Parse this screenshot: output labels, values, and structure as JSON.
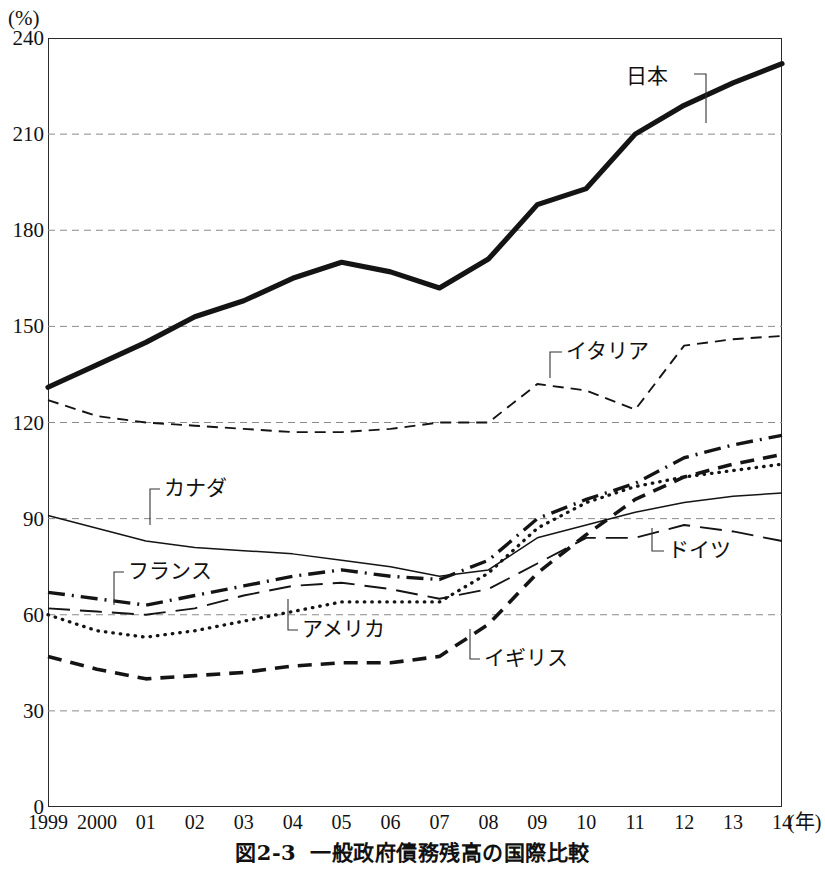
{
  "axis": {
    "unit_label": "(%)",
    "x_unit_label": "(年)",
    "y_ticks": [
      0,
      30,
      60,
      90,
      120,
      150,
      180,
      210,
      240
    ],
    "x_ticks": [
      "1999",
      "2000",
      "01",
      "02",
      "03",
      "04",
      "05",
      "06",
      "07",
      "08",
      "09",
      "10",
      "11",
      "12",
      "13",
      "14"
    ]
  },
  "caption": {
    "number": "図2-3",
    "title": "一般政府債務残高の国際比較"
  },
  "labels": {
    "japan": "日本",
    "italy": "イタリア",
    "canada": "カナダ",
    "france": "フランス",
    "germany": "ドイツ",
    "usa": "アメリカ",
    "uk": "イギリス"
  },
  "chart_data": {
    "type": "line",
    "title": "一般政府債務残高の国際比較",
    "xlabel": "(年)",
    "ylabel": "(%)",
    "xlim": [
      1999,
      2014
    ],
    "ylim": [
      0,
      240
    ],
    "y_ticks": [
      0,
      30,
      60,
      90,
      120,
      150,
      180,
      210,
      240
    ],
    "grid": "horizontal-dashed",
    "legend": "inline-annotations",
    "x": [
      1999,
      2000,
      2001,
      2002,
      2003,
      2004,
      2005,
      2006,
      2007,
      2008,
      2009,
      2010,
      2011,
      2012,
      2013,
      2014
    ],
    "series": [
      {
        "name": "日本",
        "name_en": "Japan",
        "style": "thick-solid",
        "values": [
          131,
          138,
          145,
          153,
          158,
          165,
          170,
          167,
          162,
          171,
          188,
          193,
          210,
          219,
          226,
          232
        ]
      },
      {
        "name": "イタリア",
        "name_en": "Italy",
        "style": "dashed",
        "values": [
          127,
          122,
          120,
          119,
          118,
          117,
          117,
          118,
          120,
          120,
          132,
          130,
          124,
          144,
          146,
          147
        ]
      },
      {
        "name": "カナダ",
        "name_en": "Canada",
        "style": "thin-solid",
        "values": [
          91,
          87,
          83,
          81,
          80,
          79,
          77,
          75,
          72,
          74,
          84,
          88,
          92,
          95,
          97,
          98
        ]
      },
      {
        "name": "フランス",
        "name_en": "France",
        "style": "dash-dot",
        "values": [
          67,
          65,
          63,
          66,
          69,
          72,
          74,
          72,
          71,
          77,
          90,
          96,
          101,
          109,
          113,
          116
        ]
      },
      {
        "name": "ドイツ",
        "name_en": "Germany",
        "style": "long-dash",
        "values": [
          62,
          61,
          60,
          62,
          66,
          69,
          70,
          68,
          65,
          68,
          76,
          84,
          84,
          88,
          86,
          83
        ]
      },
      {
        "name": "アメリカ",
        "name_en": "United States",
        "style": "dotted",
        "values": [
          60,
          55,
          53,
          55,
          58,
          61,
          64,
          64,
          64,
          73,
          87,
          95,
          100,
          103,
          105,
          107
        ]
      },
      {
        "name": "イギリス",
        "name_en": "United Kingdom",
        "style": "bold-dashed",
        "values": [
          47,
          43,
          40,
          41,
          42,
          44,
          45,
          45,
          47,
          57,
          73,
          85,
          96,
          103,
          107,
          110
        ]
      }
    ]
  }
}
